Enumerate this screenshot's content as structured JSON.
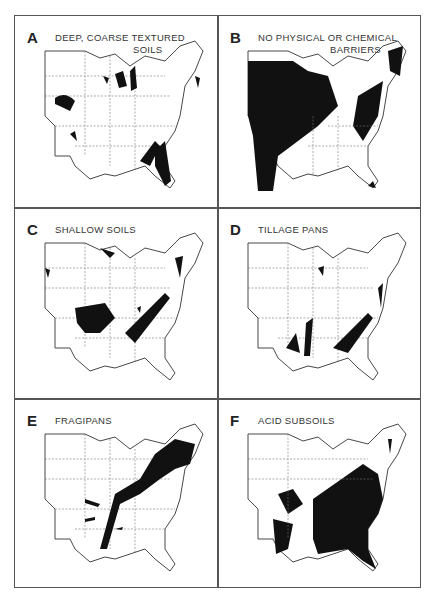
{
  "figure": {
    "panels": [
      {
        "letter": "A",
        "title": "DEEP, COARSE TEXTURED",
        "title_line2": "SOILS"
      },
      {
        "letter": "B",
        "title": "NO PHYSICAL OR CHEMICAL",
        "title_line2": "BARRIERS"
      },
      {
        "letter": "C",
        "title": "SHALLOW SOILS",
        "title_line2": ""
      },
      {
        "letter": "D",
        "title": "TILLAGE PANS",
        "title_line2": ""
      },
      {
        "letter": "E",
        "title": "FRAGIPANS",
        "title_line2": ""
      },
      {
        "letter": "F",
        "title": "ACID SUBSOILS",
        "title_line2": ""
      }
    ]
  }
}
